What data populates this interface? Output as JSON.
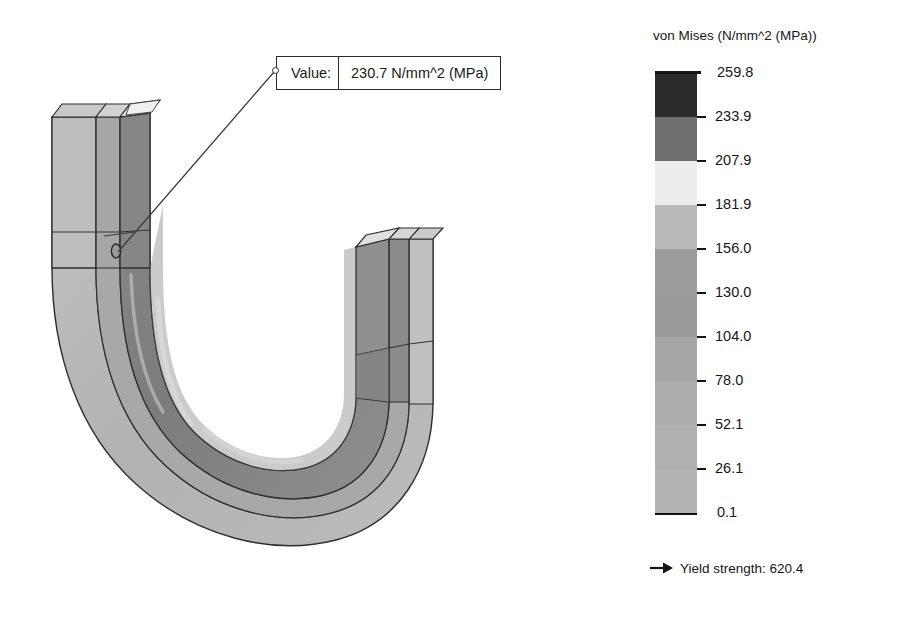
{
  "callout": {
    "label": "Value:",
    "value": "230.7 N/mm^2 (MPa)",
    "anchor_icon": "callout-anchor-circle-icon"
  },
  "legend": {
    "title": "von Mises (N/mm^2 (MPa))",
    "ticks": [
      {
        "label": "259.8",
        "value": 259.8
      },
      {
        "label": "233.9",
        "value": 233.9
      },
      {
        "label": "207.9",
        "value": 207.9
      },
      {
        "label": "181.9",
        "value": 181.9
      },
      {
        "label": "156.0",
        "value": 156.0
      },
      {
        "label": "130.0",
        "value": 130.0
      },
      {
        "label": "104.0",
        "value": 104.0
      },
      {
        "label": "78.0",
        "value": 78.0
      },
      {
        "label": "52.1",
        "value": 52.1
      },
      {
        "label": "26.1",
        "value": 26.1
      },
      {
        "label": "0.1",
        "value": 0.1
      }
    ],
    "band_colors": [
      "#2b2b2b",
      "#6f6f6f",
      "#ececec",
      "#b9b9b9",
      "#9c9c9c",
      "#9a9a9a",
      "#a6a6a6",
      "#adadad",
      "#b0b0b0",
      "#b4b4b4"
    ]
  },
  "yield": {
    "arrow_icon": "right-arrow-icon",
    "text": "Yield strength: 620.4"
  },
  "model": {
    "name": "u-bend-channel-beam",
    "description": "von Mises stress contour plot of a U-shaped C-channel beam",
    "contour_colors": {
      "outer_flange_light": "#bdbdbd",
      "outer_flange_mid": "#a9a9a9",
      "web_dark": "#8d8d8d",
      "web_darker": "#7d7d7d",
      "web_mid": "#989898",
      "inner_band_light": "#c9c9c9",
      "highlight": "#d8d8d8",
      "edge": "#2e2e2e",
      "top_face": "#b6b6b6",
      "top_face_light": "#cfcfcf"
    }
  },
  "chart_data": {
    "type": "heatmap",
    "title": "von Mises (N/mm^2 (MPa))",
    "colorbar_ticks": [
      259.8,
      233.9,
      207.9,
      181.9,
      156.0,
      130.0,
      104.0,
      78.0,
      52.1,
      26.1,
      0.1
    ],
    "range": [
      0.1,
      259.8
    ],
    "annotations": [
      {
        "text": "Value: 230.7 N/mm^2 (MPa)",
        "value": 230.7
      },
      {
        "text": "Yield strength: 620.4",
        "value": 620.4
      }
    ],
    "colormap": "grayscale",
    "legend_position": "right"
  }
}
